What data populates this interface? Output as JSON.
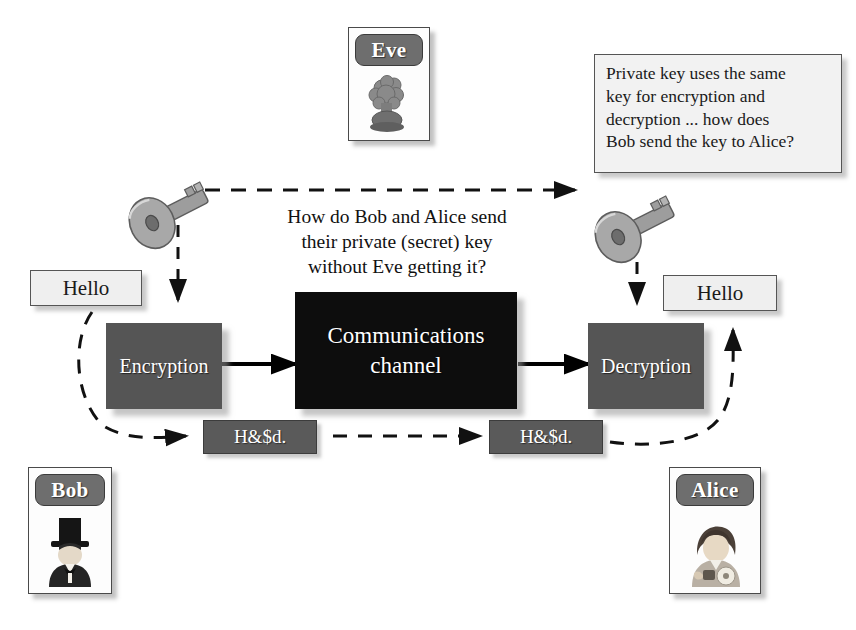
{
  "diagram": {
    "background_color": "#ffffff",
    "accent_dark": "#555555",
    "accent_black": "#0d0d0d"
  },
  "actors": [
    {
      "name": "Eve",
      "icon": "eve-explosion-avatar-icon"
    },
    {
      "name": "Bob",
      "icon": "bob-tophat-avatar-icon"
    },
    {
      "name": "Alice",
      "icon": "alice-woman-avatar-icon"
    }
  ],
  "annotations": {
    "question_center": "How do Bob and Alice send their private (secret) key without Eve getting it?",
    "question_center_lines": [
      "How do Bob and Alice send",
      "their private (secret) key",
      "without Eve getting it?"
    ],
    "callout": "Private key uses the same key for encryption and decryption ... how does Bob send the key to Alice?",
    "callout_lines": [
      "Private key uses the same",
      "key for encryption and",
      "decryption ... how does",
      "Bob send the key to Alice?"
    ]
  },
  "plaintext": {
    "left_label": "Hello",
    "right_label": "Hello"
  },
  "ciphertext": {
    "left_label": "H&$d.",
    "right_label": "H&$d."
  },
  "process": {
    "encryption_label": "Encryption",
    "channel_label": "Communications channel",
    "channel_lines": [
      "Communications",
      "channel"
    ],
    "decryption_label": "Decryption"
  },
  "keys": [
    {
      "id": "sender-key",
      "icon": "key-icon"
    },
    {
      "id": "receiver-key",
      "icon": "key-icon"
    }
  ],
  "arrows": [
    {
      "id": "key-transfer",
      "style": "dashed",
      "direction": "left-to-right"
    },
    {
      "id": "key-to-encryption",
      "style": "dashed",
      "direction": "downward"
    },
    {
      "id": "key-to-decryption",
      "style": "dashed",
      "direction": "downward"
    },
    {
      "id": "plaintext-into-encryption",
      "style": "dashed",
      "direction": "curved"
    },
    {
      "id": "encryption-to-channel",
      "style": "solid",
      "direction": "left-to-right"
    },
    {
      "id": "channel-to-decryption",
      "style": "solid",
      "direction": "left-to-right"
    },
    {
      "id": "ciphertext-transit",
      "style": "dashed",
      "direction": "left-to-right"
    },
    {
      "id": "plaintext-out-of-decryption",
      "style": "dashed",
      "direction": "curved-up"
    }
  ]
}
